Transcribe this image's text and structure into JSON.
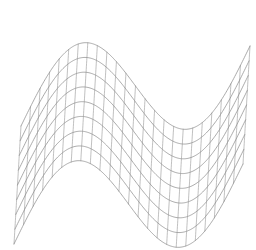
{
  "figure": {
    "title": "",
    "kind": "3d-wireframe-mesh",
    "background_color": "#ffffff",
    "line_color": "#9a9a9a",
    "width_px": 256,
    "height_px": 250
  },
  "chart_data": {
    "type": "line",
    "title": "",
    "subtitle": "",
    "xlabel": "",
    "ylabel": "",
    "zlabel": "",
    "plot_style": "wireframe-mesh",
    "surface_function": "z = A * sin(2*pi*u)",
    "grid": {
      "u_lines": 25,
      "v_lines": 9,
      "u_cells": 24,
      "v_cells": 8
    },
    "axes_visible": false,
    "ticks_visible": false,
    "gridlines": false,
    "legend": null,
    "legend_position": "none",
    "annotations": [],
    "xlim": [
      0,
      1
    ],
    "ylim": [
      0,
      1
    ],
    "zlim": [
      -1,
      1
    ],
    "surface": {
      "amplitude": 1.0,
      "cycles": 1.0,
      "phase_deg": 0
    },
    "projection": {
      "type": "oblique",
      "origin_px": [
        14,
        244
      ],
      "u_axis_px": [
        229,
        -80
      ],
      "v_axis_px": [
        7,
        -118
      ],
      "z_axis_px": [
        0,
        -62
      ],
      "u_depth_shear_px": [
        0,
        0
      ]
    },
    "u_samples": [
      0,
      0.0417,
      0.0833,
      0.125,
      0.1667,
      0.2083,
      0.25,
      0.2917,
      0.3333,
      0.375,
      0.4167,
      0.4583,
      0.5,
      0.5417,
      0.5833,
      0.625,
      0.6667,
      0.7083,
      0.75,
      0.7917,
      0.8333,
      0.875,
      0.9167,
      0.9583,
      1.0
    ],
    "v_samples": [
      0,
      0.125,
      0.25,
      0.375,
      0.5,
      0.625,
      0.75,
      0.875,
      1.0
    ],
    "z_values_at_u": [
      0.0,
      0.2588,
      0.5,
      0.7071,
      0.866,
      0.9659,
      1.0,
      0.9659,
      0.866,
      0.7071,
      0.5,
      0.2588,
      0.0,
      -0.2588,
      -0.5,
      -0.7071,
      -0.866,
      -0.9659,
      -1.0,
      -0.9659,
      -0.866,
      -0.7071,
      -0.5,
      -0.2588,
      0.0
    ]
  }
}
